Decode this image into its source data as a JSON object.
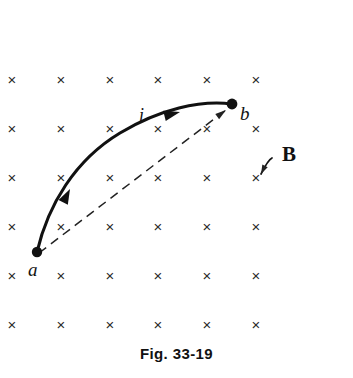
{
  "figure": {
    "caption": "Fig. 33-19",
    "background_color": "#ffffff",
    "ink_color": "#111111",
    "width": 353,
    "height": 378
  },
  "field": {
    "label": "B",
    "symbol": "×",
    "meaning": "uniform magnetic field into the page",
    "grid": {
      "columns": 6,
      "rows": 6,
      "x_positions": [
        12,
        61,
        110,
        158,
        207,
        256
      ],
      "y_positions": [
        79,
        128,
        177,
        226,
        275,
        324
      ],
      "glyph_size_px": 15
    },
    "annotation": {
      "label": "B",
      "label_x": 282,
      "label_y": 161,
      "pointer_from_x": 272,
      "pointer_from_y": 158,
      "pointer_to_x": 261,
      "pointer_to_y": 174
    }
  },
  "points": [
    {
      "id": "a",
      "label": "a",
      "x": 37,
      "y": 252,
      "label_x": 28,
      "label_y": 276
    },
    {
      "id": "b",
      "label": "b",
      "x": 232,
      "y": 104,
      "label_x": 240,
      "label_y": 120
    }
  ],
  "paths": {
    "wire": {
      "name": "curved current-carrying wire",
      "style": "solid",
      "label": "i",
      "label_x": 139,
      "label_y": 121,
      "d": "M 37,252 C 48,205 75,160 120,133 C 160,109 200,100 232,104",
      "arrowheads": [
        {
          "x": 70,
          "y": 189,
          "angle_deg": -63
        },
        {
          "x": 180,
          "y": 112,
          "angle_deg": -14
        }
      ]
    },
    "chord": {
      "name": "straight dashed line from a to b",
      "style": "dashed",
      "d": "M 39,253 L 226,110",
      "arrowheads": [
        {
          "x": 226,
          "y": 110,
          "angle_deg": -37
        }
      ]
    }
  }
}
